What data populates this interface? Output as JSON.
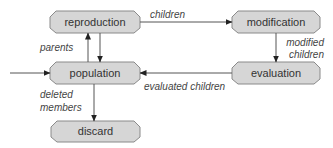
{
  "diagram": {
    "type": "flowchart",
    "colors": {
      "node_fill": "#d6d6d6",
      "node_border": "#8a8a8a",
      "edge": "#555555",
      "text": "#333333",
      "edge_text": "#444444"
    },
    "nodes": {
      "reproduction": {
        "label": "reproduction"
      },
      "modification": {
        "label": "modification"
      },
      "population": {
        "label": "population"
      },
      "evaluation": {
        "label": "evaluation"
      },
      "discard": {
        "label": "discard"
      }
    },
    "edges": {
      "children": {
        "from": "reproduction",
        "to": "modification",
        "label": "children"
      },
      "modified_children": {
        "from": "modification",
        "to": "evaluation",
        "label_line1": "modified",
        "label_line2": "children"
      },
      "evaluated_children": {
        "from": "evaluation",
        "to": "population",
        "label": "evaluated children"
      },
      "parents": {
        "from": "population",
        "to": "reproduction",
        "label": "parents"
      },
      "return": {
        "from": "reproduction",
        "to": "population",
        "label": ""
      },
      "deleted_members": {
        "from": "population",
        "to": "discard",
        "label_line1": "deleted",
        "label_line2": "members"
      },
      "input": {
        "from": "external",
        "to": "population",
        "label": ""
      }
    }
  }
}
